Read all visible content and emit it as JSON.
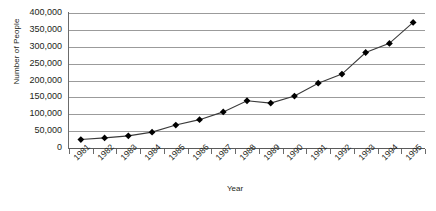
{
  "chart_data": {
    "type": "line",
    "title": "",
    "xlabel": "Year",
    "ylabel": "Number of People",
    "categories": [
      "1981",
      "1982",
      "1983",
      "1984",
      "1985",
      "1986",
      "1987",
      "1988",
      "1989",
      "1990",
      "1991",
      "1992",
      "1993",
      "1994",
      "1995"
    ],
    "values": [
      25000,
      30000,
      36000,
      47000,
      68000,
      84000,
      107000,
      140000,
      133000,
      154000,
      192000,
      219000,
      283000,
      310000,
      372000
    ],
    "series": [
      {
        "name": "Number of People",
        "values": [
          25000,
          30000,
          36000,
          47000,
          68000,
          84000,
          107000,
          140000,
          133000,
          154000,
          192000,
          219000,
          283000,
          310000,
          372000
        ]
      }
    ],
    "ylim": [
      0,
      400000
    ],
    "ytick_labels": [
      "400,000",
      "350,000",
      "300,000",
      "250,000",
      "200,000",
      "150,000",
      "100,000",
      "50,000",
      "0"
    ],
    "ytick_values": [
      400000,
      350000,
      300000,
      250000,
      200000,
      150000,
      100000,
      50000,
      0
    ],
    "grid": true,
    "grid_axis": "y",
    "legend": false,
    "legend_position": "none",
    "marker": "diamond",
    "line_color": "#3a3a3a",
    "marker_color": "#000000",
    "grid_color": "#9b9b9b",
    "axis_color": "#6b6b6b",
    "background": "#ffffff"
  }
}
